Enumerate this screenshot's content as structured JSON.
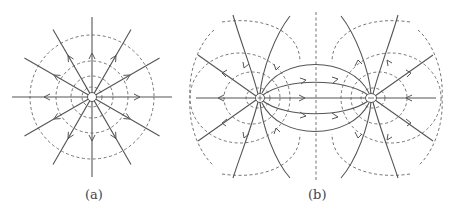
{
  "figure": {
    "panels": [
      {
        "id": "a",
        "caption": "(a)",
        "description": "Field lines and equipotentials of a single point charge",
        "charge": {
          "x": 92,
          "y": 97,
          "r": 4.5
        },
        "equipotential_radii": [
          10,
          21,
          36,
          62
        ],
        "field_line_angles_deg": [
          0,
          30,
          60,
          90,
          120,
          150,
          180,
          210,
          240,
          270,
          300,
          330
        ],
        "field_line_length": 82
      },
      {
        "id": "b",
        "caption": "(b)",
        "description": "Field lines and equipotentials of an electric dipole",
        "charges": [
          {
            "sign": "+",
            "x": 260,
            "y": 98
          },
          {
            "sign": "-",
            "x": 371,
            "y": 98
          }
        ]
      }
    ],
    "colors": {
      "line": "#555555",
      "dash": "#666666"
    }
  }
}
